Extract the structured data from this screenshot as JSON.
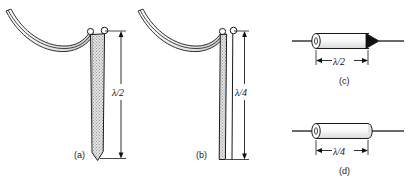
{
  "figure": {
    "kind": "antenna-configuration-diagram",
    "background_color": "#ffffff",
    "line_color": "#1a1a1a",
    "fill_shade": "#d8d8d8",
    "solid_black": "#111111"
  },
  "panels": [
    {
      "id": "a",
      "caption": "(a)",
      "dimension_label": "λ/2",
      "element_type": "vertical-tapered-dipole",
      "element_end": "pointed",
      "feed": "curved-twin-lead-transmission-line",
      "terminals": 2
    },
    {
      "id": "b",
      "caption": "(b)",
      "dimension_label": "λ/4",
      "element_type": "vertical-narrow-parallel-conductors",
      "element_end": "flat",
      "feed": "curved-twin-lead-transmission-line",
      "terminals": 2
    },
    {
      "id": "c",
      "caption": "(c)",
      "dimension_label": "λ/2",
      "element_type": "horizontal-cylinder-with-cone-tip",
      "element_end": "cone-point",
      "feed": "inline-wire",
      "terminals": 0
    },
    {
      "id": "d",
      "caption": "(d)",
      "dimension_label": "λ/4",
      "element_type": "horizontal-cylinder-rounded-ends",
      "element_end": "rounded",
      "feed": "inline-wire",
      "terminals": 0
    }
  ]
}
